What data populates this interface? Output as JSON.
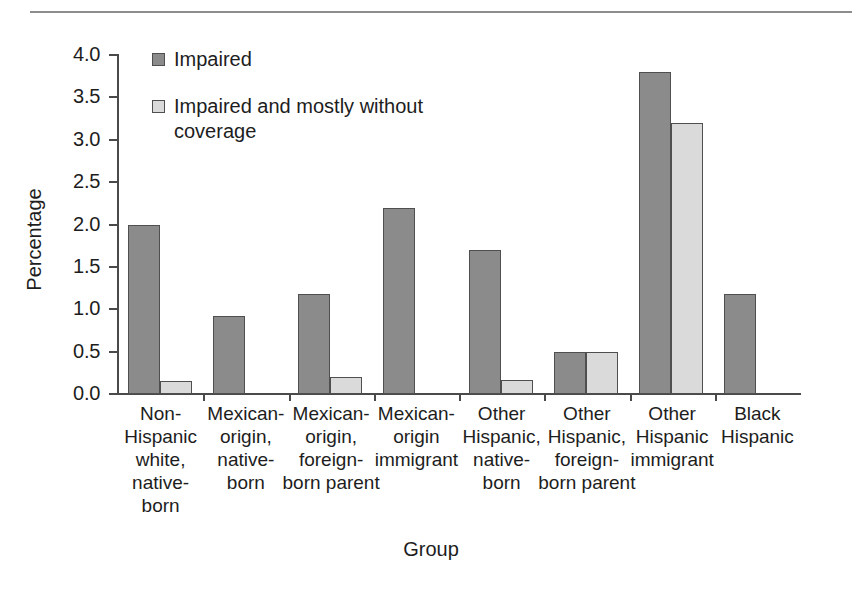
{
  "chart_data": {
    "type": "bar",
    "title": "",
    "xlabel": "Group",
    "ylabel": "Percentage",
    "ylim": [
      0.0,
      4.0
    ],
    "ytick_labels": [
      "4.0",
      "3.5",
      "3.0",
      "2.5",
      "2.0",
      "1.5",
      "1.0",
      "0.5",
      "0.0"
    ],
    "ytick_values": [
      4.0,
      3.5,
      3.0,
      2.5,
      2.0,
      1.5,
      1.0,
      0.5,
      0.0
    ],
    "grid": false,
    "legend_position": "upper-left-inside",
    "categories": [
      "Non-Hispanic white, native-born",
      "Mexican-origin, native-born",
      "Mexican-origin, foreign-born parent",
      "Mexican-origin immigrant",
      "Other Hispanic, native-born",
      "Other Hispanic, foreign-born parent",
      "Other Hispanic immigrant",
      "Black Hispanic"
    ],
    "category_lines": [
      [
        "Non-",
        "Hispanic",
        "white,",
        "native-",
        "born"
      ],
      [
        "Mexican-",
        "origin,",
        "native-",
        "born"
      ],
      [
        "Mexican-",
        "origin,",
        "foreign-",
        "born parent"
      ],
      [
        "Mexican-",
        "origin",
        "immigrant"
      ],
      [
        "Other",
        "Hispanic,",
        "native-",
        "born"
      ],
      [
        "Other",
        "Hispanic,",
        "foreign-",
        "born parent"
      ],
      [
        "Other",
        "Hispanic",
        "immigrant"
      ],
      [
        "Black",
        "Hispanic"
      ]
    ],
    "series": [
      {
        "name": "Impaired",
        "color": "#8b8b8b",
        "values": [
          2.0,
          0.92,
          1.18,
          2.2,
          1.7,
          0.5,
          3.8,
          1.18
        ]
      },
      {
        "name": "Impaired and mostly without coverage",
        "color": "#dadada",
        "values": [
          0.15,
          0.0,
          0.2,
          0.0,
          0.17,
          0.5,
          3.2,
          0.0
        ]
      }
    ]
  },
  "legend": {
    "entries": [
      {
        "label": "Impaired",
        "swatch": "dark"
      },
      {
        "label": "Impaired and mostly without coverage",
        "swatch": "light"
      }
    ]
  },
  "axes": {
    "y_title": "Percentage",
    "x_title": "Group"
  },
  "colors": {
    "series_dark": "#8b8b8b",
    "series_light": "#dadada",
    "axis": "#4a4a4a",
    "text": "#1d1d1d",
    "rule": "#8d8d8d"
  }
}
